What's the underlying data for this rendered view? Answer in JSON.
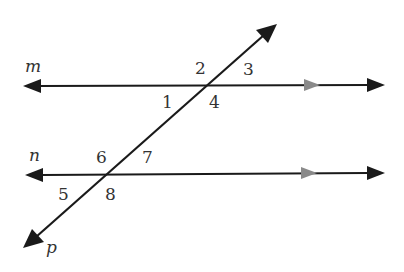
{
  "diagram": {
    "type": "parallel-lines-cut-by-transversal",
    "colors": {
      "line": "#1a1a1a",
      "parallel_marker": "#8a8a8a",
      "label": "#333333",
      "background": "#ffffff"
    },
    "lines": {
      "m": {
        "label": "m"
      },
      "n": {
        "label": "n"
      },
      "p": {
        "label": "p"
      }
    },
    "angles": [
      "1",
      "2",
      "3",
      "4",
      "5",
      "6",
      "7",
      "8"
    ]
  }
}
